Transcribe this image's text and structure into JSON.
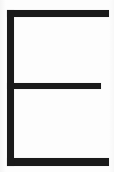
{
  "canvas": {
    "width": 114,
    "height": 172,
    "background_color": "#fdfdfd",
    "ink_color": "#1a1a1a"
  },
  "glyph": {
    "character": "E",
    "name": "latin-capital-letter-e",
    "description": "Thin-stroke capital letter E rendered as solid dark bars on a white background",
    "stroke_color": "#1a1a1a"
  },
  "strokes": {
    "stem": {
      "name": "vertical-stem",
      "x": 7,
      "y": 10,
      "width": 7,
      "height": 156
    },
    "arm_top": {
      "name": "top-arm",
      "x": 7,
      "y": 10,
      "width": 102,
      "height": 7
    },
    "arm_middle": {
      "name": "middle-arm",
      "x": 7,
      "y": 83,
      "width": 94,
      "height": 6
    },
    "arm_bottom": {
      "name": "bottom-arm",
      "x": 7,
      "y": 158,
      "width": 102,
      "height": 8
    }
  }
}
